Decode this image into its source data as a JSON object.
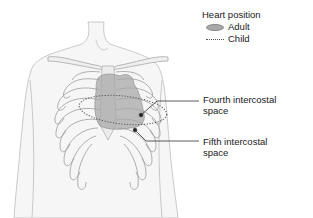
{
  "legend": {
    "title": "Heart position",
    "items": [
      {
        "label": "Adult",
        "style": "filled-oval",
        "color": "#a9a9a9"
      },
      {
        "label": "Child",
        "style": "dotted-line",
        "color": "#555555"
      }
    ]
  },
  "annotations": [
    {
      "line1": "Fourth intercostal",
      "line2": "space"
    },
    {
      "line1": "Fifth intercostal",
      "line2": "space"
    }
  ],
  "colors": {
    "outline": "#b8b8b8",
    "ribs": "#9a9a9a",
    "heart_fill": "#b0b0b0",
    "leader": "#333333"
  }
}
